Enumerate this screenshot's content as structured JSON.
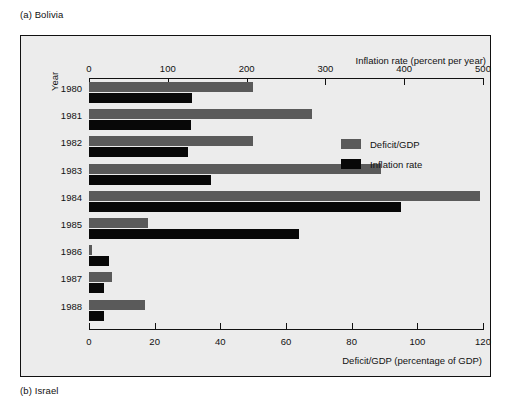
{
  "caption_top": "(a)  Bolivia",
  "caption_bottom": "(b)  Israel",
  "axes": {
    "top_title": "Inflation rate (percent per year)",
    "bottom_title": "Deficit/GDP (percentage of GDP)",
    "y_title": "Year",
    "top_ticks": [
      "0",
      "100",
      "200",
      "300",
      "400",
      "500"
    ],
    "bottom_ticks": [
      "0",
      "20",
      "40",
      "60",
      "80",
      "100",
      "120"
    ]
  },
  "legend": {
    "items": [
      {
        "label": "Deficit/GDP",
        "color": "#5a5a5a"
      },
      {
        "label": "Inflation rate",
        "color": "#080808"
      }
    ]
  },
  "chart_data": {
    "type": "bar",
    "orientation": "horizontal",
    "title": "",
    "subtitle": "(a)  Bolivia",
    "categories": [
      "1980",
      "1981",
      "1982",
      "1983",
      "1984",
      "1985",
      "1986",
      "1987",
      "1988"
    ],
    "xlabel": "Deficit/GDP (percentage of GDP)",
    "xlabel_top": "Inflation rate (percent per year)",
    "ylabel": "Year",
    "grid": false,
    "legend_position": "inside-top-right",
    "xlim_top": [
      0,
      500
    ],
    "xlim_bottom": [
      0,
      120
    ],
    "series": [
      {
        "name": "Deficit/GDP",
        "axis": "bottom",
        "unit": "percentage of GDP",
        "color": "#5a5a5a",
        "values": [
          50,
          68,
          50,
          89,
          119,
          18,
          1,
          7,
          17
        ]
      },
      {
        "name": "Inflation rate",
        "axis": "top",
        "unit": "percent per year",
        "color": "#080808",
        "values": [
          131,
          129,
          126,
          155,
          396,
          266,
          25,
          19,
          19
        ]
      }
    ]
  }
}
